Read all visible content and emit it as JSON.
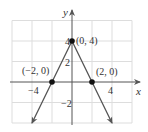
{
  "chart_data": {
    "type": "line",
    "title": "",
    "function": "y = 4 - 2|x|",
    "xlabel": "x",
    "ylabel": "y",
    "xlim": [
      -6,
      6
    ],
    "ylim": [
      -4,
      6
    ],
    "grid": true,
    "grid_step": 2,
    "x_ticks": [
      {
        "value": -4,
        "label": "−4"
      },
      {
        "value": 4,
        "label": "4"
      }
    ],
    "y_ticks": [
      {
        "value": 4,
        "label": "4"
      },
      {
        "value": 2,
        "label": "2"
      },
      {
        "value": -2,
        "label": "−2"
      }
    ],
    "series": [
      {
        "name": "graph",
        "x": [
          -4,
          -2,
          0,
          2,
          4
        ],
        "y": [
          -4,
          0,
          4,
          0,
          -4
        ],
        "arrows": "both-ends"
      }
    ],
    "points": [
      {
        "x": -2,
        "y": 0,
        "label": "(−2, 0)"
      },
      {
        "x": 0,
        "y": 4,
        "label": "(0, 4)"
      },
      {
        "x": 2,
        "y": 0,
        "label": "(2, 0)"
      }
    ],
    "colors": {
      "line": "#555555",
      "grid": "#dddddd",
      "axis": "#555555",
      "point": "#111111"
    }
  }
}
